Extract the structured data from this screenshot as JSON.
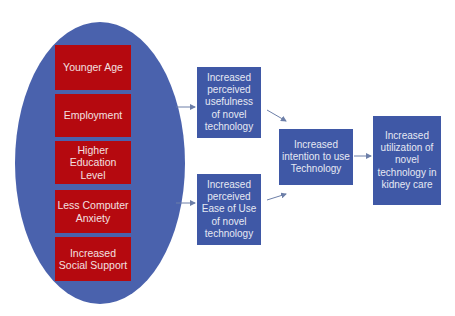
{
  "factors": [
    {
      "label": "Younger Age"
    },
    {
      "label": "Employment"
    },
    {
      "label": "Higher Education Level"
    },
    {
      "label": "Less Computer Anxiety"
    },
    {
      "label": "Increased Social Support"
    }
  ],
  "perceptions": {
    "usefulness": "Increased perceived usefulness of novel technology",
    "ease_of_use": "Increased perceived Ease of Use of novel technology"
  },
  "intention": "Increased intention to use Technology",
  "outcome": "Increased utilization of novel technology in kidney care",
  "colors": {
    "ellipse": "#4a62ad",
    "factor_box": "#b5090f",
    "node_box": "#3f58a6",
    "arrow": "#6d7fa8"
  }
}
